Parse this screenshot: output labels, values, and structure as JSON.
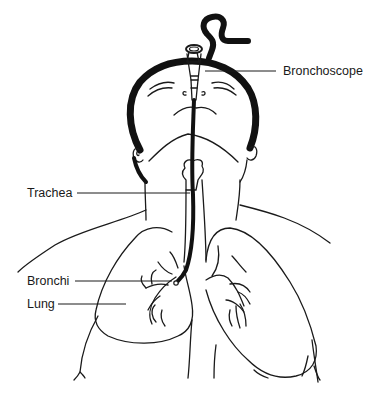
{
  "diagram": {
    "colors": {
      "line": "#1a1a1a",
      "background": "#ffffff"
    },
    "labels": [
      {
        "id": "bronchoscope",
        "text": "Bronchoscope"
      },
      {
        "id": "trachea",
        "text": "Trachea"
      },
      {
        "id": "bronchi",
        "text": "Bronchi"
      },
      {
        "id": "lung",
        "text": "Lung"
      }
    ]
  }
}
